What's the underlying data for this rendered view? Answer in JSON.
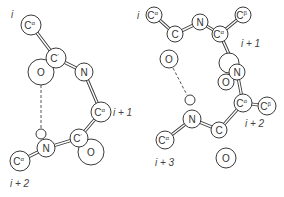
{
  "diagram": {
    "left": {
      "name": "gamma-turn",
      "residue_labels": [
        {
          "text": "i",
          "x": 11,
          "y": 14
        },
        {
          "text": "i + 1",
          "x": 113,
          "y": 112
        },
        {
          "text": "i + 2",
          "x": 10,
          "y": 183
        }
      ],
      "atoms": [
        {
          "id": "CA1",
          "label": "C",
          "sup": "α",
          "x": 31,
          "y": 25,
          "r": 10
        },
        {
          "id": "O1",
          "label": "O",
          "sup": "",
          "x": 41,
          "y": 72,
          "r": 13
        },
        {
          "id": "C1",
          "label": "C",
          "sup": "′",
          "x": 56,
          "y": 58,
          "r": 10
        },
        {
          "id": "N2",
          "label": "N",
          "sup": "",
          "x": 84,
          "y": 72,
          "r": 9
        },
        {
          "id": "CA2",
          "label": "C",
          "sup": "α",
          "x": 101,
          "y": 112,
          "r": 10
        },
        {
          "id": "O2",
          "label": "O",
          "sup": "",
          "x": 91,
          "y": 152,
          "r": 13
        },
        {
          "id": "C2",
          "label": "C",
          "sup": "′",
          "x": 79,
          "y": 138,
          "r": 9
        },
        {
          "id": "H3",
          "label": "",
          "sup": "",
          "x": 41,
          "y": 134,
          "r": 5
        },
        {
          "id": "N3",
          "label": "N",
          "sup": "",
          "x": 46,
          "y": 148,
          "r": 9
        },
        {
          "id": "CA3",
          "label": "C",
          "sup": "α",
          "x": 20,
          "y": 161,
          "r": 10
        }
      ],
      "bonds": [
        [
          "CA1",
          "C1"
        ],
        [
          "C1",
          "N2"
        ],
        [
          "N2",
          "CA2"
        ],
        [
          "CA2",
          "C2"
        ],
        [
          "C2",
          "N3"
        ],
        [
          "N3",
          "CA3"
        ]
      ],
      "hbond": {
        "x1": 41,
        "y1": 85,
        "x2": 41,
        "y2": 129
      }
    },
    "right": {
      "name": "beta-turn",
      "residue_labels": [
        {
          "text": "i",
          "x": 137,
          "y": 15
        },
        {
          "text": "i + 1",
          "x": 241,
          "y": 43
        },
        {
          "text": "i + 2",
          "x": 245,
          "y": 123
        },
        {
          "text": "i + 3",
          "x": 155,
          "y": 162
        }
      ],
      "atoms": [
        {
          "id": "CA1",
          "label": "C",
          "sup": "α",
          "x": 154,
          "y": 15,
          "r": 8
        },
        {
          "id": "C1",
          "label": "C",
          "sup": "",
          "x": 175,
          "y": 34,
          "r": 8
        },
        {
          "id": "O1",
          "label": "O",
          "sup": "",
          "x": 169,
          "y": 59,
          "r": 9
        },
        {
          "id": "N2",
          "label": "N",
          "sup": "",
          "x": 200,
          "y": 22,
          "r": 8
        },
        {
          "id": "CB2",
          "label": "C",
          "sup": "β",
          "x": 243,
          "y": 15,
          "r": 8
        },
        {
          "id": "CA2",
          "label": "C",
          "sup": "α",
          "x": 220,
          "y": 34,
          "r": 8
        },
        {
          "id": "O2",
          "label": "",
          "sup": "",
          "x": 229,
          "y": 63,
          "r": 10
        },
        {
          "id": "O2b",
          "label": "O",
          "sup": "",
          "x": 226,
          "y": 82,
          "r": 8
        },
        {
          "id": "N3",
          "label": "N",
          "sup": "",
          "x": 237,
          "y": 72,
          "r": 8
        },
        {
          "id": "CB3",
          "label": "C",
          "sup": "β",
          "x": 267,
          "y": 106,
          "r": 9
        },
        {
          "id": "CA3",
          "label": "C",
          "sup": "α",
          "x": 243,
          "y": 103,
          "r": 9
        },
        {
          "id": "O3",
          "label": "O",
          "sup": "",
          "x": 226,
          "y": 158,
          "r": 10
        },
        {
          "id": "C3",
          "label": "C",
          "sup": "",
          "x": 219,
          "y": 130,
          "r": 8
        },
        {
          "id": "H4",
          "label": "",
          "sup": "",
          "x": 190,
          "y": 100,
          "r": 5
        },
        {
          "id": "N4",
          "label": "N",
          "sup": "",
          "x": 192,
          "y": 119,
          "r": 9
        },
        {
          "id": "CA4",
          "label": "C",
          "sup": "α",
          "x": 165,
          "y": 140,
          "r": 9
        }
      ],
      "bonds": [
        [
          "CA1",
          "C1"
        ],
        [
          "C1",
          "N2"
        ],
        [
          "N2",
          "CA2"
        ],
        [
          "CA2",
          "CB2"
        ],
        [
          "CA2",
          "N3"
        ],
        [
          "N3",
          "CA3"
        ],
        [
          "CA3",
          "CB3"
        ],
        [
          "CA3",
          "C3"
        ],
        [
          "C3",
          "N4"
        ],
        [
          "N4",
          "CA4"
        ]
      ],
      "hbond": {
        "x1": 173,
        "y1": 68,
        "x2": 187,
        "y2": 95
      }
    }
  }
}
